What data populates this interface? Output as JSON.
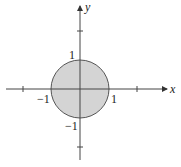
{
  "diagram": {
    "axes": {
      "x_label": "x",
      "y_label": "y"
    },
    "tick_labels": {
      "x_pos": "1",
      "x_neg": "−1",
      "y_pos": "1",
      "y_neg": "−1"
    },
    "disk": {
      "radius": 1,
      "fill": "#d4d4d4",
      "stroke": "#555555"
    },
    "colors": {
      "axis": "#444444"
    }
  }
}
